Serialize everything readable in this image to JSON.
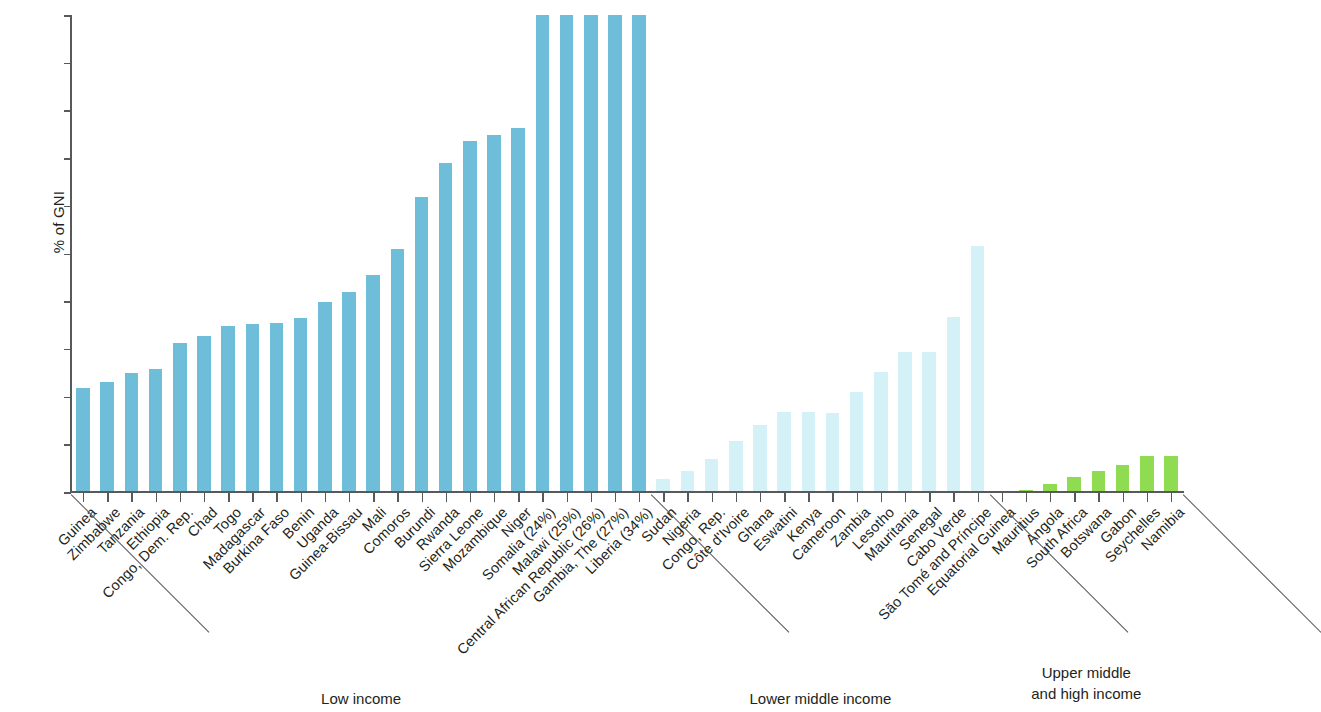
{
  "chart_data": {
    "type": "bar",
    "title": "",
    "subtitle": "",
    "xlabel": "",
    "ylabel": "% of GNI",
    "ylim": [
      0,
      20
    ],
    "y_ticks": [
      0,
      2,
      4,
      6,
      8,
      10,
      12,
      14,
      16,
      18,
      20
    ],
    "grid": false,
    "legend_position": "none",
    "note": "Bars exceeding the 20% axis maximum are clipped at 20; their true values appear in parentheses in the category label.",
    "colors": {
      "low_income": "#6FBED9",
      "lower_middle_income": "#D4F1F8",
      "upper_middle_and_high_income": "#8FDC52",
      "axis": "#58595b",
      "text": "#231f20"
    },
    "groups": [
      {
        "name": "low-income",
        "label": "Low income",
        "color": "#6FBED9",
        "categories": [
          "Guinea",
          "Zimbabwe",
          "Tanzania",
          "Ethiopia",
          "Congo, Dem. Rep.",
          "Chad",
          "Togo",
          "Madagascar",
          "Burkina Faso",
          "Benin",
          "Uganda",
          "Guinea-Bissau",
          "Mali",
          "Comoros",
          "Burundi",
          "Rwanda",
          "Sierra Leone",
          "Mozambique",
          "Niger",
          "Somalia (24%)",
          "Malawi (25%)",
          "Central African Republic (26%)",
          "Gambia, The (27%)",
          "Liberia (34%)"
        ],
        "values": [
          4.35,
          4.6,
          5.0,
          5.15,
          6.25,
          6.55,
          6.95,
          7.05,
          7.1,
          7.3,
          7.95,
          8.4,
          9.1,
          10.2,
          12.35,
          13.8,
          14.7,
          14.95,
          15.25,
          20,
          20,
          20,
          20,
          20
        ],
        "true_values": [
          4.35,
          4.6,
          5.0,
          5.15,
          6.25,
          6.55,
          6.95,
          7.05,
          7.1,
          7.3,
          7.95,
          8.4,
          9.1,
          10.2,
          12.35,
          13.8,
          14.7,
          14.95,
          15.25,
          24,
          25,
          26,
          27,
          34
        ]
      },
      {
        "name": "lower-middle-income",
        "label": "Lower middle income",
        "color": "#D4F1F8",
        "categories": [
          "Sudan",
          "Nigeria",
          "Congo, Rep.",
          "Côte d'Ivoire",
          "Ghana",
          "Eswatini",
          "Kenya",
          "Cameroon",
          "Zambia",
          "Lesotho",
          "Mauritania",
          "Senegal",
          "Cabo Verde",
          "São Tomé and Príncipe"
        ],
        "values": [
          0.55,
          0.9,
          1.4,
          2.15,
          2.8,
          3.35,
          3.35,
          3.3,
          4.2,
          5.05,
          5.85,
          5.85,
          7.35,
          10.3
        ]
      },
      {
        "name": "upper-middle-and-high-income",
        "label": "Upper middle\nand high income",
        "color": "#8FDC52",
        "categories": [
          "Equatorial Guinea",
          "Mauritius",
          "Angola",
          "South Africa",
          "Botswana",
          "Gabon",
          "Seychelles",
          "Namibia"
        ],
        "values": [
          0.05,
          0.1,
          0.35,
          0.65,
          0.9,
          1.15,
          1.5,
          1.5
        ]
      }
    ]
  }
}
